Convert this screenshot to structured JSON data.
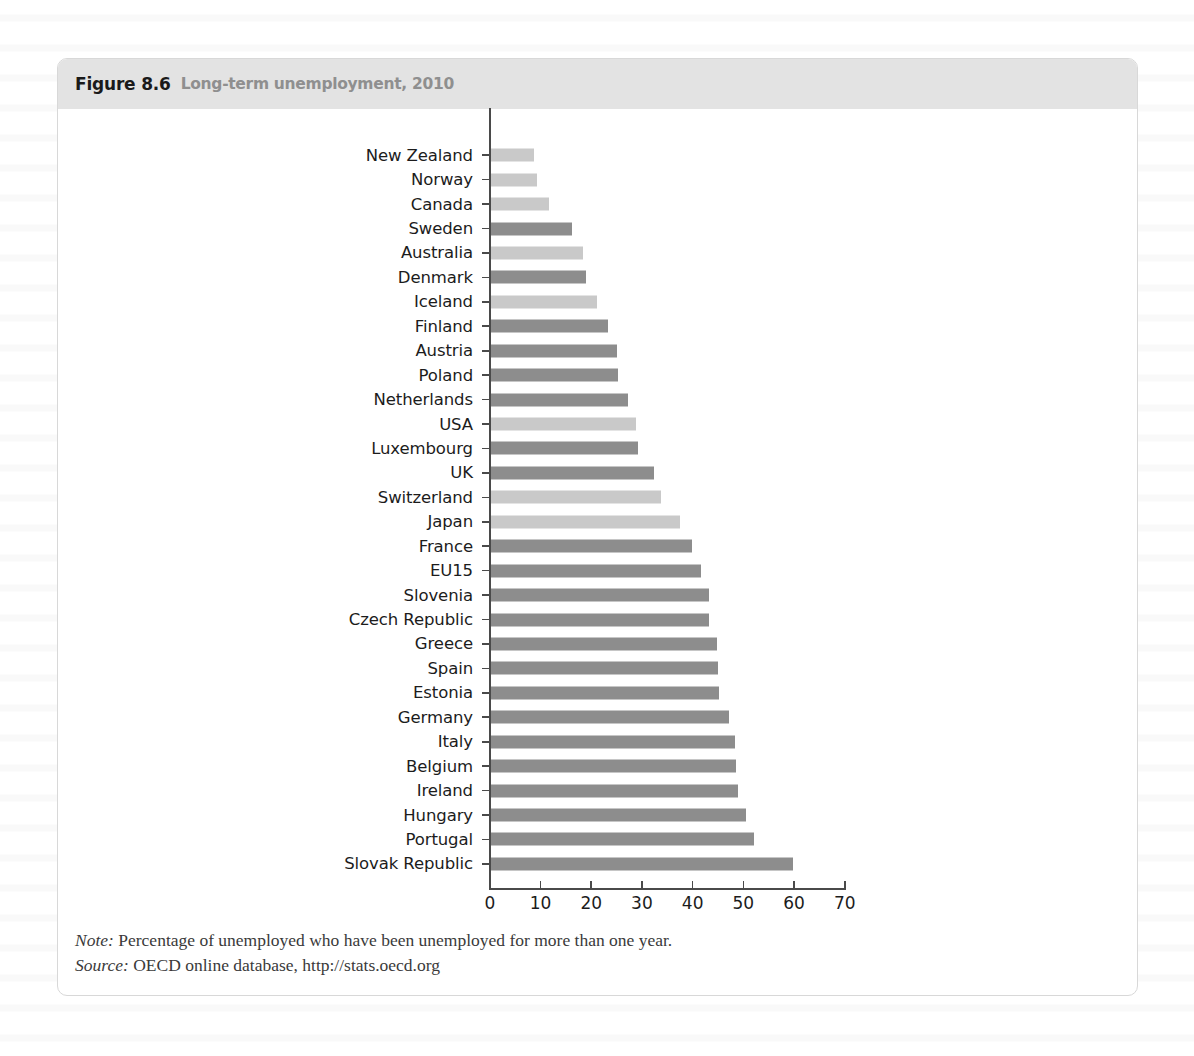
{
  "figure": {
    "number": "Figure 8.6",
    "title": "Long-term unemployment, 2010"
  },
  "footnotes": {
    "note_label": "Note:",
    "note_text": "Percentage of unemployed who have been unemployed for more than one year.",
    "source_label": "Source:",
    "source_text": "OECD online database, http://stats.oecd.org"
  },
  "colors": {
    "bar_dark": "#8d8d8d",
    "bar_light": "#c9c9c9",
    "header_band": "#e3e3e3",
    "axis": "#4a4a4a",
    "panel_border": "#d8d8d8",
    "title_grey": "#8f8f8f"
  },
  "chart_data": {
    "type": "bar",
    "orientation": "horizontal",
    "title": "Long-term unemployment, 2010",
    "xlabel": "",
    "ylabel": "",
    "xlim": [
      0,
      70
    ],
    "xticks": [
      0,
      10,
      20,
      30,
      40,
      50,
      60,
      70
    ],
    "grid": false,
    "legend": null,
    "note": "Percentage of unemployed who have been unemployed for more than one year.",
    "source": "OECD online database, http://stats.oecd.org",
    "categories": [
      "New Zealand",
      "Norway",
      "Canada",
      "Sweden",
      "Australia",
      "Denmark",
      "Iceland",
      "Finland",
      "Austria",
      "Poland",
      "Netherlands",
      "USA",
      "Luxembourg",
      "UK",
      "Switzerland",
      "Japan",
      "France",
      "EU15",
      "Slovenia",
      "Czech Republic",
      "Greece",
      "Spain",
      "Estonia",
      "Germany",
      "Italy",
      "Belgium",
      "Ireland",
      "Hungary",
      "Portugal",
      "Slovak Republic"
    ],
    "values": [
      8.9,
      9.4,
      11.8,
      16.4,
      18.5,
      19.1,
      21.2,
      23.4,
      25.2,
      25.5,
      27.5,
      29.0,
      29.3,
      32.6,
      33.9,
      37.6,
      40.1,
      41.8,
      43.3,
      43.4,
      45.0,
      45.1,
      45.4,
      47.3,
      48.5,
      48.8,
      49.1,
      50.6,
      52.3,
      59.9
    ],
    "shades": [
      "light",
      "light",
      "light",
      "dark",
      "light",
      "dark",
      "light",
      "dark",
      "dark",
      "dark",
      "dark",
      "light",
      "dark",
      "dark",
      "light",
      "light",
      "dark",
      "dark",
      "dark",
      "dark",
      "dark",
      "dark",
      "dark",
      "dark",
      "dark",
      "dark",
      "dark",
      "dark",
      "dark",
      "dark"
    ]
  }
}
